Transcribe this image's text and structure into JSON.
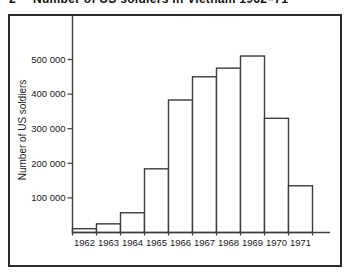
{
  "figure": {
    "number": "2",
    "title": "Number of US soldiers in Vietnam 1962–71"
  },
  "chart_data": {
    "type": "bar",
    "title": "Number of US soldiers in Vietnam 1962–71",
    "categories": [
      "1962",
      "1963",
      "1964",
      "1965",
      "1966",
      "1967",
      "1968",
      "1969",
      "1970",
      "1971"
    ],
    "values": [
      11000,
      25000,
      57000,
      184000,
      383000,
      450000,
      475000,
      510000,
      330000,
      135000
    ],
    "xlabel": "",
    "ylabel": "Number of US soldiers",
    "ylim": [
      0,
      530000
    ],
    "y_ticks": [
      100000,
      200000,
      300000,
      400000,
      500000
    ],
    "y_tick_labels": [
      "100 000",
      "200 000",
      "300 000",
      "400 000",
      "500 000"
    ],
    "grid": false,
    "legend": "none",
    "bar_fill": "#ffffff",
    "bar_stroke": "#3c3c3c"
  },
  "colors": {
    "background": "#ffffff",
    "frame": "#2b2b2b",
    "axis": "#3c3c3c",
    "text": "#1a1a1a"
  }
}
